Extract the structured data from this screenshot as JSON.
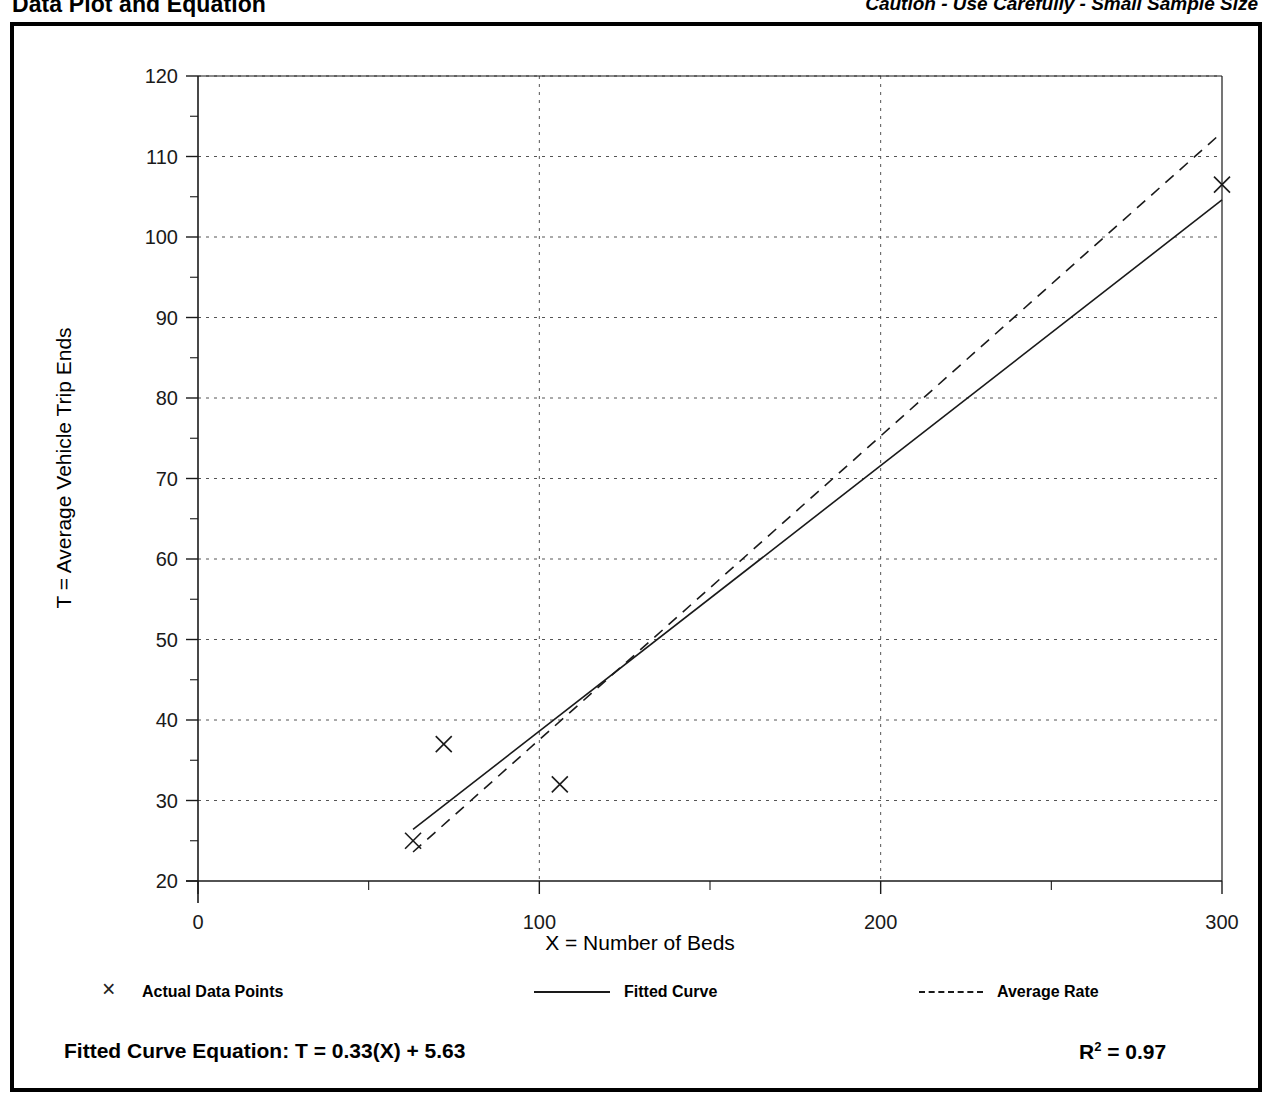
{
  "header": {
    "title": "Data Plot and Equation",
    "caution": "Caution - Use Carefully - Small Sample Size"
  },
  "equation": {
    "fitted_label": "Fitted Curve Equation:  T = 0.33(X) + 5.63",
    "r_squared_base": "R",
    "r_squared_exp": "2",
    "r_squared_value": " = 0.97"
  },
  "legend": {
    "actual": "Actual Data Points",
    "fitted": "Fitted Curve",
    "average": "Average Rate"
  },
  "axes": {
    "x_title": "X = Number of Beds",
    "y_title": "T = Average Vehicle Trip Ends"
  },
  "chart_data": {
    "type": "scatter",
    "title": "Data Plot and Equation",
    "xlabel": "X = Number of Beds",
    "ylabel": "T = Average Vehicle Trip Ends",
    "xlim": [
      0,
      300
    ],
    "ylim": [
      20,
      120
    ],
    "x_ticks": [
      0,
      100,
      200,
      300
    ],
    "x_tick_labels": [
      "0",
      "100",
      "200",
      "300"
    ],
    "x_minor_tick_step": 50,
    "y_ticks": [
      20,
      30,
      40,
      50,
      60,
      70,
      80,
      90,
      100,
      110,
      120
    ],
    "y_tick_labels": [
      "20",
      "30",
      "40",
      "50",
      "60",
      "70",
      "80",
      "90",
      "100",
      "110",
      "120"
    ],
    "y_minor_tick_step": 5,
    "grid": true,
    "grid_style": "dotted",
    "legend_position": "below",
    "series": [
      {
        "name": "Actual Data Points",
        "type": "scatter",
        "marker": "x",
        "points": [
          {
            "x": 63,
            "y": 25
          },
          {
            "x": 72,
            "y": 37
          },
          {
            "x": 106,
            "y": 32
          },
          {
            "x": 300,
            "y": 106.5
          }
        ]
      },
      {
        "name": "Fitted Curve",
        "type": "line",
        "style": "solid",
        "equation": "T = 0.33(X) + 5.63",
        "slope": 0.33,
        "intercept": 5.63,
        "x_range": [
          63,
          300
        ],
        "endpoints": [
          {
            "x": 63,
            "y": 26.4
          },
          {
            "x": 300,
            "y": 104.6
          }
        ]
      },
      {
        "name": "Average Rate",
        "type": "line",
        "style": "dashed",
        "x_range": [
          63,
          300
        ],
        "endpoints": [
          {
            "x": 63,
            "y": 23.6
          },
          {
            "x": 300,
            "y": 113.0
          }
        ]
      }
    ],
    "r_squared": 0.97,
    "annotations": [
      "Caution - Use Carefully - Small Sample Size",
      "Fitted Curve Equation:  T = 0.33(X) + 5.63",
      "R2 = 0.97"
    ]
  },
  "colors": {
    "frame": "#000000",
    "axis": "#1a1a1a",
    "grid": "#555555",
    "background": "#ffffff"
  }
}
